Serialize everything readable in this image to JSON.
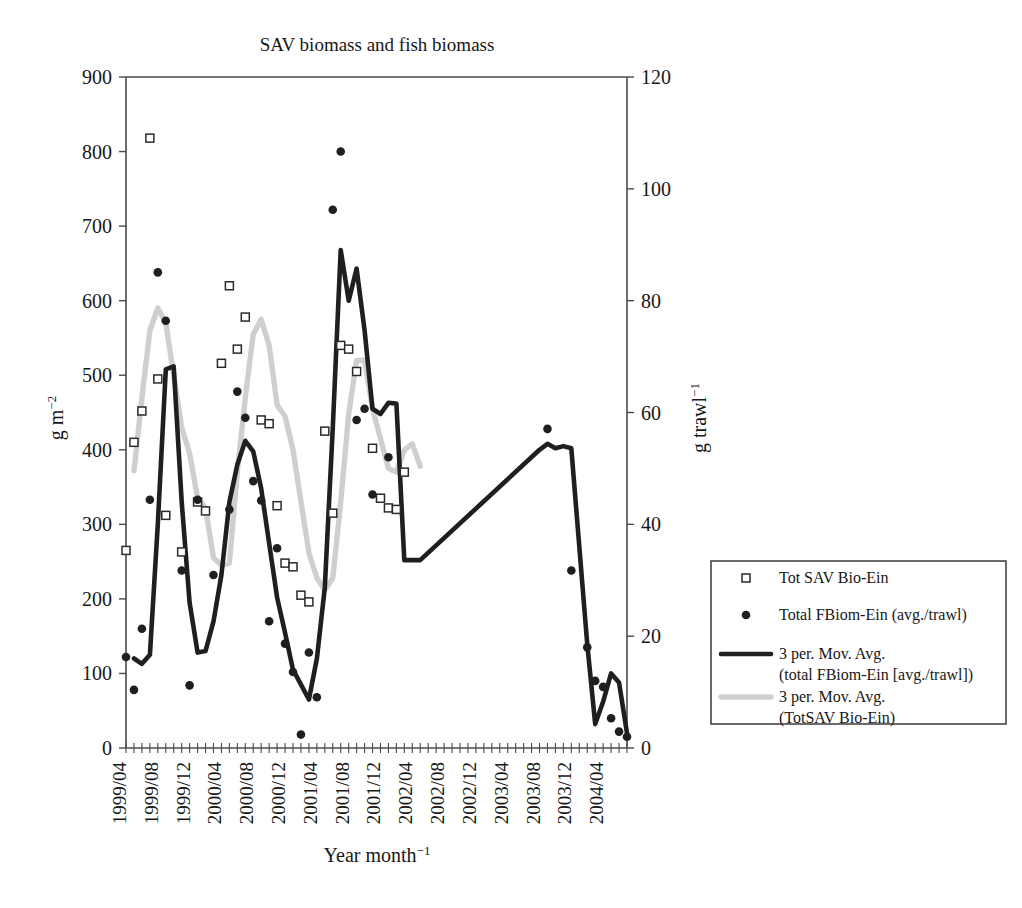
{
  "chart_data": {
    "type": "line",
    "title": "SAV biomass and fish biomass",
    "xlabel": "Year month−1",
    "ylabel": "g m−2",
    "y2label": "g trawl−1",
    "ylim": [
      0,
      900
    ],
    "y2lim": [
      0,
      120
    ],
    "ytick_labels": [
      "0",
      "100",
      "200",
      "300",
      "400",
      "500",
      "600",
      "700",
      "800",
      "900"
    ],
    "ytick_values": [
      0,
      100,
      200,
      300,
      400,
      500,
      600,
      700,
      800,
      900
    ],
    "y2tick_labels": [
      "0",
      "20",
      "40",
      "60",
      "80",
      "100",
      "120"
    ],
    "y2tick_values": [
      0,
      20,
      40,
      60,
      80,
      100,
      120
    ],
    "grid": false,
    "legend_position": "right",
    "xtick_labels": [
      "1999/04",
      "1999/08",
      "1999/12",
      "2000/04",
      "2000/08",
      "2000/12",
      "2001/04",
      "2001/08",
      "2001/12",
      "2002/04",
      "2002/08",
      "2002/12",
      "2003/04",
      "2003/08",
      "2003/12",
      "2004/04"
    ],
    "x_start": "1999/04",
    "x_end": "2004/07",
    "x_tick_interval_months": 4,
    "x_minor_tick_interval_months": 1,
    "series": [
      {
        "name": "Tot SAV Bio-Ein",
        "marker": "open-square",
        "axis": "left",
        "unit": "g m-2",
        "points": [
          {
            "x": "1999/04",
            "y": 265
          },
          {
            "x": "1999/05",
            "y": 410
          },
          {
            "x": "1999/06",
            "y": 452
          },
          {
            "x": "1999/07",
            "y": 818
          },
          {
            "x": "1999/08",
            "y": 495
          },
          {
            "x": "1999/09",
            "y": 312
          },
          {
            "x": "1999/11",
            "y": 263
          },
          {
            "x": "2000/01",
            "y": 330
          },
          {
            "x": "2000/02",
            "y": 318
          },
          {
            "x": "2000/04",
            "y": 516
          },
          {
            "x": "2000/05",
            "y": 620
          },
          {
            "x": "2000/06",
            "y": 535
          },
          {
            "x": "2000/07",
            "y": 578
          },
          {
            "x": "2000/09",
            "y": 440
          },
          {
            "x": "2000/10",
            "y": 435
          },
          {
            "x": "2000/11",
            "y": 325
          },
          {
            "x": "2000/12",
            "y": 248
          },
          {
            "x": "2001/01",
            "y": 243
          },
          {
            "x": "2001/02",
            "y": 205
          },
          {
            "x": "2001/03",
            "y": 196
          },
          {
            "x": "2001/05",
            "y": 425
          },
          {
            "x": "2001/06",
            "y": 315
          },
          {
            "x": "2001/07",
            "y": 540
          },
          {
            "x": "2001/08",
            "y": 535
          },
          {
            "x": "2001/09",
            "y": 505
          },
          {
            "x": "2001/11",
            "y": 402
          },
          {
            "x": "2001/12",
            "y": 335
          },
          {
            "x": "2002/01",
            "y": 322
          },
          {
            "x": "2002/02",
            "y": 320
          },
          {
            "x": "2002/03",
            "y": 370
          }
        ]
      },
      {
        "name": "Total FBiom-Ein (avg./trawl)",
        "marker": "filled-circle",
        "axis": "right",
        "unit": "g trawl-1",
        "points_left_scale": [
          {
            "x": "1999/04",
            "y": 122
          },
          {
            "x": "1999/05",
            "y": 78
          },
          {
            "x": "1999/06",
            "y": 160
          },
          {
            "x": "1999/07",
            "y": 333
          },
          {
            "x": "1999/08",
            "y": 638
          },
          {
            "x": "1999/09",
            "y": 573
          },
          {
            "x": "1999/11",
            "y": 238
          },
          {
            "x": "1999/12",
            "y": 84
          },
          {
            "x": "2000/01",
            "y": 333
          },
          {
            "x": "2000/03",
            "y": 232
          },
          {
            "x": "2000/05",
            "y": 320
          },
          {
            "x": "2000/06",
            "y": 478
          },
          {
            "x": "2000/07",
            "y": 443
          },
          {
            "x": "2000/08",
            "y": 358
          },
          {
            "x": "2000/09",
            "y": 332
          },
          {
            "x": "2000/10",
            "y": 170
          },
          {
            "x": "2000/11",
            "y": 268
          },
          {
            "x": "2000/12",
            "y": 140
          },
          {
            "x": "2001/01",
            "y": 102
          },
          {
            "x": "2001/02",
            "y": 18
          },
          {
            "x": "2001/03",
            "y": 128
          },
          {
            "x": "2001/04",
            "y": 68
          },
          {
            "x": "2001/06",
            "y": 722
          },
          {
            "x": "2001/07",
            "y": 800
          },
          {
            "x": "2001/09",
            "y": 440
          },
          {
            "x": "2001/10",
            "y": 455
          },
          {
            "x": "2001/11",
            "y": 340
          },
          {
            "x": "2002/01",
            "y": 390
          },
          {
            "x": "2003/09",
            "y": 428
          },
          {
            "x": "2003/12",
            "y": 238
          },
          {
            "x": "2004/02",
            "y": 135
          },
          {
            "x": "2004/03",
            "y": 90
          },
          {
            "x": "2004/04",
            "y": 82
          },
          {
            "x": "2004/05",
            "y": 40
          },
          {
            "x": "2004/06",
            "y": 22
          },
          {
            "x": "2004/07",
            "y": 15
          }
        ]
      },
      {
        "name": "3 per. Mov. Avg. (total FBiom-Ein [avg./trawl])",
        "style": "thick-dark-line",
        "axis": "right",
        "points_left_scale": [
          {
            "x": "1999/05",
            "y": 120
          },
          {
            "x": "1999/06",
            "y": 113
          },
          {
            "x": "1999/07",
            "y": 125
          },
          {
            "x": "1999/08",
            "y": 300
          },
          {
            "x": "1999/09",
            "y": 508
          },
          {
            "x": "1999/10",
            "y": 512
          },
          {
            "x": "1999/11",
            "y": 330
          },
          {
            "x": "1999/12",
            "y": 195
          },
          {
            "x": "2000/01",
            "y": 128
          },
          {
            "x": "2000/02",
            "y": 130
          },
          {
            "x": "2000/03",
            "y": 170
          },
          {
            "x": "2000/04",
            "y": 232
          },
          {
            "x": "2000/05",
            "y": 330
          },
          {
            "x": "2000/06",
            "y": 380
          },
          {
            "x": "2000/07",
            "y": 412
          },
          {
            "x": "2000/08",
            "y": 398
          },
          {
            "x": "2000/09",
            "y": 348
          },
          {
            "x": "2000/10",
            "y": 275
          },
          {
            "x": "2000/11",
            "y": 202
          },
          {
            "x": "2000/12",
            "y": 155
          },
          {
            "x": "2001/01",
            "y": 105
          },
          {
            "x": "2001/02",
            "y": 85
          },
          {
            "x": "2001/03",
            "y": 65
          },
          {
            "x": "2001/04",
            "y": 120
          },
          {
            "x": "2001/05",
            "y": 215
          },
          {
            "x": "2001/06",
            "y": 430
          },
          {
            "x": "2001/07",
            "y": 668
          },
          {
            "x": "2001/08",
            "y": 600
          },
          {
            "x": "2001/09",
            "y": 643
          },
          {
            "x": "2001/10",
            "y": 560
          },
          {
            "x": "2001/11",
            "y": 455
          },
          {
            "x": "2001/12",
            "y": 448
          },
          {
            "x": "2002/01",
            "y": 463
          },
          {
            "x": "2002/02",
            "y": 462
          },
          {
            "x": "2002/03",
            "y": 252
          },
          {
            "x": "2002/05",
            "y": 252
          },
          {
            "x": "2003/08",
            "y": 400
          },
          {
            "x": "2003/09",
            "y": 408
          },
          {
            "x": "2003/10",
            "y": 402
          },
          {
            "x": "2003/11",
            "y": 405
          },
          {
            "x": "2003/12",
            "y": 402
          },
          {
            "x": "2004/02",
            "y": 140
          },
          {
            "x": "2004/03",
            "y": 32
          },
          {
            "x": "2004/04",
            "y": 62
          },
          {
            "x": "2004/05",
            "y": 100
          },
          {
            "x": "2004/06",
            "y": 88
          },
          {
            "x": "2004/07",
            "y": 20
          }
        ]
      },
      {
        "name": "3 per. Mov. Avg. (TotSAV Bio-Ein)",
        "style": "thick-gray-line",
        "axis": "left",
        "points": [
          {
            "x": "1999/05",
            "y": 372
          },
          {
            "x": "1999/06",
            "y": 470
          },
          {
            "x": "1999/07",
            "y": 560
          },
          {
            "x": "1999/08",
            "y": 590
          },
          {
            "x": "1999/09",
            "y": 570
          },
          {
            "x": "1999/10",
            "y": 500
          },
          {
            "x": "1999/11",
            "y": 430
          },
          {
            "x": "1999/12",
            "y": 395
          },
          {
            "x": "2000/01",
            "y": 335
          },
          {
            "x": "2000/02",
            "y": 322
          },
          {
            "x": "2000/03",
            "y": 255
          },
          {
            "x": "2000/04",
            "y": 245
          },
          {
            "x": "2000/05",
            "y": 248
          },
          {
            "x": "2000/06",
            "y": 370
          },
          {
            "x": "2000/07",
            "y": 470
          },
          {
            "x": "2000/08",
            "y": 555
          },
          {
            "x": "2000/09",
            "y": 575
          },
          {
            "x": "2000/10",
            "y": 540
          },
          {
            "x": "2000/11",
            "y": 460
          },
          {
            "x": "2000/12",
            "y": 445
          },
          {
            "x": "2001/01",
            "y": 400
          },
          {
            "x": "2001/02",
            "y": 330
          },
          {
            "x": "2001/03",
            "y": 262
          },
          {
            "x": "2001/04",
            "y": 228
          },
          {
            "x": "2001/05",
            "y": 212
          },
          {
            "x": "2001/06",
            "y": 228
          },
          {
            "x": "2001/07",
            "y": 330
          },
          {
            "x": "2001/08",
            "y": 448
          },
          {
            "x": "2001/09",
            "y": 520
          },
          {
            "x": "2001/10",
            "y": 520
          },
          {
            "x": "2001/11",
            "y": 455
          },
          {
            "x": "2001/12",
            "y": 415
          },
          {
            "x": "2002/01",
            "y": 375
          },
          {
            "x": "2002/02",
            "y": 370
          },
          {
            "x": "2002/03",
            "y": 400
          },
          {
            "x": "2002/04",
            "y": 408
          },
          {
            "x": "2002/05",
            "y": 378
          }
        ]
      }
    ]
  },
  "legend": {
    "items": [
      {
        "marker": "open-square",
        "label": "Tot SAV Bio-Ein",
        "label2": ""
      },
      {
        "marker": "filled-circle",
        "label": "Total FBiom-Ein (avg./trawl)",
        "label2": ""
      },
      {
        "marker": "dark-line",
        "label": "3 per. Mov. Avg.",
        "label2": "(total FBiom-Ein [avg./trawl])"
      },
      {
        "marker": "gray-line",
        "label": "3 per. Mov. Avg.",
        "label2": "(TotSAV Bio-Ein)"
      }
    ]
  },
  "colors": {
    "dark_line": "#1f1f1f",
    "gray_line": "#cfcfcf",
    "marker_edge": "#2a2a2a",
    "axis": "#4a4a4a",
    "text": "#171717",
    "background": "#ffffff"
  }
}
